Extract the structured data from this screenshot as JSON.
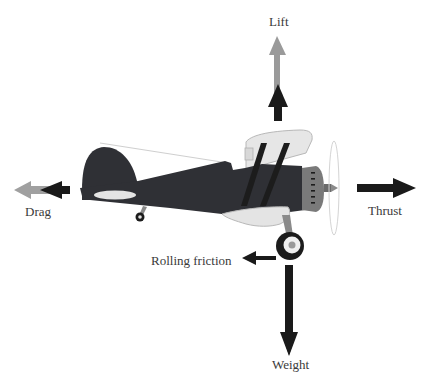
{
  "diagram": {
    "type": "force-diagram",
    "forces": [
      {
        "id": "lift",
        "label": "Lift",
        "direction": "up",
        "color_primary": "#1a1a1a",
        "color_secondary": "#9a9a9a"
      },
      {
        "id": "drag",
        "label": "Drag",
        "direction": "left",
        "color_primary": "#1a1a1a",
        "color_secondary": "#9a9a9a"
      },
      {
        "id": "thrust",
        "label": "Thrust",
        "direction": "right",
        "color_primary": "#1a1a1a"
      },
      {
        "id": "rolling_friction",
        "label": "Rolling friction",
        "direction": "left",
        "color_primary": "#1a1a1a"
      },
      {
        "id": "weight",
        "label": "Weight",
        "direction": "down",
        "color_primary": "#1a1a1a"
      }
    ]
  },
  "labels": {
    "lift": "Lift",
    "drag": "Drag",
    "thrust": "Thrust",
    "rolling_friction": "Rolling friction",
    "weight": "Weight"
  },
  "colors": {
    "fuselage": "#2f3035",
    "wing": "#e4e4e4",
    "wing_outline": "#b8b8b8",
    "struts": "#1c1c1c",
    "cowling": "#7a7a7a",
    "arrow_dark": "#1a1a1a",
    "arrow_light": "#9a9a9a",
    "text": "#3a3a3a"
  }
}
